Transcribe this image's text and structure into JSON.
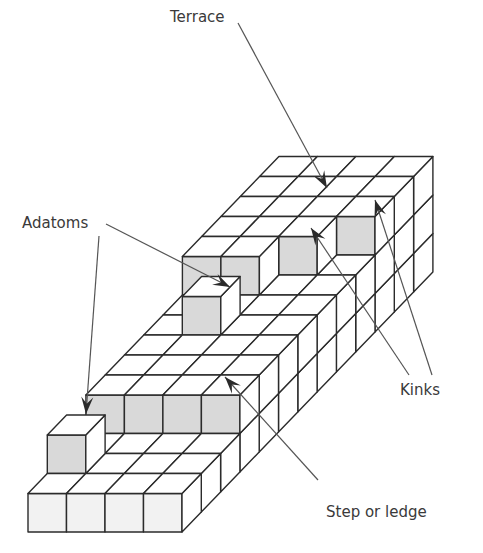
{
  "figure": {
    "labels": {
      "terrace": "Terrace",
      "adatoms": "Adatoms",
      "kinks": "Kinks",
      "step": "Step or ledge"
    },
    "colors": {
      "line": "#2b2b2b",
      "leader": "#555555",
      "arrow": "#2a2a2a",
      "shaded_face": "#d9d9d9",
      "light_face": "#f2f2f2",
      "white_face": "#ffffff"
    }
  }
}
